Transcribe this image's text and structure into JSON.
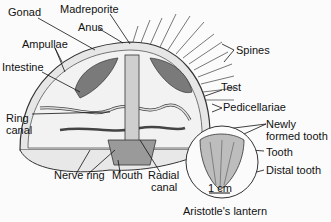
{
  "diagram": {
    "labels": {
      "gonad": "Gonad",
      "madreporite": "Madreporite",
      "anus": "Anus",
      "ampullae": "Ampullae",
      "intestine": "Intestine",
      "ring_canal_1": "Ring",
      "ring_canal_2": "canal",
      "nerve_ring": "Nerve ring",
      "mouth": "Mouth",
      "radial_canal_1": "Radial",
      "radial_canal_2": "canal",
      "spines": "Spines",
      "test": "Test",
      "pedicellariae": "Pedicellariae",
      "newly_formed_tooth_1": "Newly",
      "newly_formed_tooth_2": "formed tooth",
      "tooth": "Tooth",
      "distal_tooth": "Distal tooth",
      "scale_bar": "1 cm",
      "inset_caption": "Aristotle's lantern"
    }
  }
}
